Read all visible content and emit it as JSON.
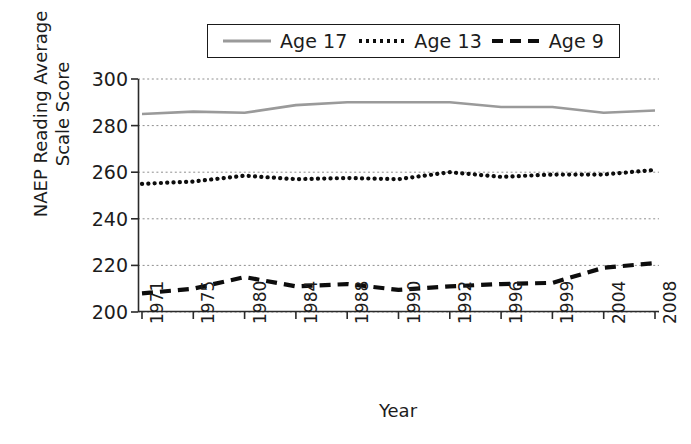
{
  "chart_data": {
    "type": "line",
    "title": "",
    "xlabel": "Year",
    "ylabel": "NAEP Reading Average\nScale Score",
    "categories": [
      "1971",
      "1975",
      "1980",
      "1984",
      "1988",
      "1990",
      "1992",
      "1996",
      "1999",
      "2004",
      "2008"
    ],
    "ylim": [
      200,
      300
    ],
    "yticks": [
      200,
      220,
      240,
      260,
      280,
      300
    ],
    "grid": true,
    "legend_position": "top",
    "series": [
      {
        "name": "Age 17",
        "style": "solid",
        "color": "#9a9a9a",
        "values": [
          285,
          286,
          285.5,
          288.8,
          290,
          290,
          290,
          288,
          288,
          285.5,
          286.5
        ]
      },
      {
        "name": "Age 13",
        "style": "dotted",
        "color": "#0d0d0d",
        "values": [
          255,
          256,
          258.5,
          257,
          257.5,
          257,
          260,
          258,
          259,
          259,
          261
        ]
      },
      {
        "name": "Age 9",
        "style": "dashed",
        "color": "#0d0d0d",
        "values": [
          208,
          210,
          215,
          211,
          212,
          209.5,
          211,
          212,
          212.5,
          219,
          221
        ]
      }
    ]
  },
  "legend": {
    "entries": [
      {
        "label": "Age 17",
        "swatch": "solid-line-swatch"
      },
      {
        "label": "Age 13",
        "swatch": "dotted-line-swatch"
      },
      {
        "label": "Age 9",
        "swatch": "dashed-line-swatch"
      }
    ]
  },
  "axes": {
    "y_tick_labels": [
      "300",
      "280",
      "260",
      "240",
      "220",
      "200"
    ],
    "x_tick_labels": [
      "1971",
      "1975",
      "1980",
      "1984",
      "1988",
      "1990",
      "1992",
      "1996",
      "1999",
      "2004",
      "2008"
    ],
    "y_axis_title_line1": "NAEP Reading Average",
    "y_axis_title_line2": "Scale Score",
    "x_axis_title": "Year"
  }
}
